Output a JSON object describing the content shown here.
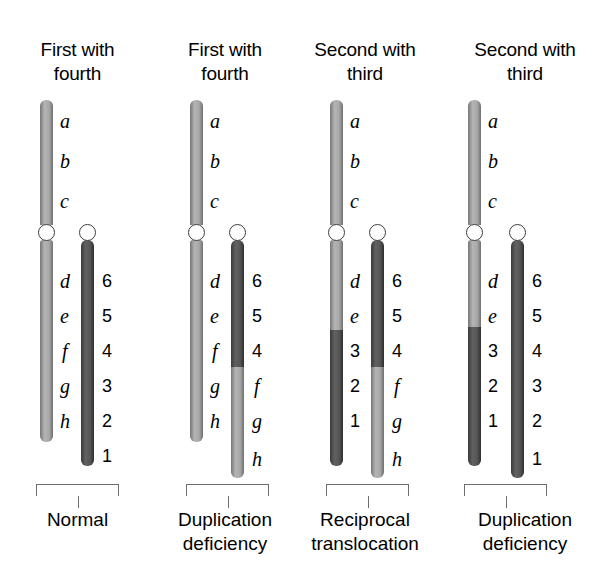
{
  "figure": {
    "title_visible": false,
    "background": "#ffffff",
    "colors": {
      "light_chromatid": "#9d9d9d",
      "dark_chromatid": "#4a4a4a",
      "centromere_fill": "#ffffff",
      "centromere_stroke": "#3d3d3d",
      "bracket": "#6e6e6e",
      "text": "#000000"
    }
  },
  "panels": [
    {
      "id": "panel-normal",
      "heading": "First with\nfourth",
      "caption": "Normal",
      "left": 0,
      "width": 155,
      "chromosomes": [
        {
          "id": "chrom-1-left",
          "x": 40,
          "width": 13,
          "top": 100,
          "bottom": 442,
          "centromere_y": 232,
          "segments": [
            {
              "from": 100,
              "to": 225,
              "shade": "light"
            },
            {
              "from": 240,
              "to": 442,
              "shade": "light"
            }
          ],
          "labels": [
            {
              "text": "a",
              "style": "italic",
              "x": 60,
              "y": 112
            },
            {
              "text": "b",
              "style": "italic",
              "x": 60,
              "y": 152
            },
            {
              "text": "c",
              "style": "italic",
              "x": 60,
              "y": 192
            },
            {
              "text": "d",
              "style": "italic",
              "x": 60,
              "y": 272
            },
            {
              "text": "e",
              "style": "italic",
              "x": 60,
              "y": 307
            },
            {
              "text": "f",
              "style": "italic",
              "x": 62,
              "y": 342
            },
            {
              "text": "g",
              "style": "italic",
              "x": 60,
              "y": 377
            },
            {
              "text": "h",
              "style": "italic",
              "x": 60,
              "y": 412
            }
          ]
        },
        {
          "id": "chrom-1-right",
          "x": 81,
          "width": 13,
          "top": 240,
          "bottom": 466,
          "centromere_y": 232,
          "segments": [
            {
              "from": 240,
              "to": 466,
              "shade": "dark"
            }
          ],
          "labels": [
            {
              "text": "6",
              "style": "upright",
              "x": 102,
              "y": 272
            },
            {
              "text": "5",
              "style": "upright",
              "x": 102,
              "y": 307
            },
            {
              "text": "4",
              "style": "upright",
              "x": 102,
              "y": 342
            },
            {
              "text": "3",
              "style": "upright",
              "x": 102,
              "y": 377
            },
            {
              "text": "2",
              "style": "upright",
              "x": 102,
              "y": 412
            },
            {
              "text": "1",
              "style": "upright",
              "x": 102,
              "y": 447
            }
          ]
        }
      ],
      "bracket": {
        "x": 36,
        "width": 83,
        "y": 484,
        "height": 12,
        "stem_height": 12
      }
    },
    {
      "id": "panel-dup-def-1",
      "heading": "First with\nfourth",
      "caption": "Duplication\ndeficiency",
      "left": 155,
      "width": 140,
      "chromosomes": [
        {
          "id": "chrom-2-left",
          "x": 190,
          "width": 13,
          "top": 100,
          "bottom": 442,
          "centromere_y": 232,
          "segments": [
            {
              "from": 100,
              "to": 225,
              "shade": "light"
            },
            {
              "from": 240,
              "to": 442,
              "shade": "light"
            }
          ],
          "labels": [
            {
              "text": "a",
              "style": "italic",
              "x": 210,
              "y": 112
            },
            {
              "text": "b",
              "style": "italic",
              "x": 210,
              "y": 152
            },
            {
              "text": "c",
              "style": "italic",
              "x": 210,
              "y": 192
            },
            {
              "text": "d",
              "style": "italic",
              "x": 210,
              "y": 272
            },
            {
              "text": "e",
              "style": "italic",
              "x": 210,
              "y": 307
            },
            {
              "text": "f",
              "style": "italic",
              "x": 212,
              "y": 342
            },
            {
              "text": "g",
              "style": "italic",
              "x": 210,
              "y": 377
            },
            {
              "text": "h",
              "style": "italic",
              "x": 210,
              "y": 412
            }
          ]
        },
        {
          "id": "chrom-2-right",
          "x": 231,
          "width": 13,
          "top": 240,
          "bottom": 478,
          "centromere_y": 232,
          "segments": [
            {
              "from": 240,
              "to": 367,
              "shade": "dark"
            },
            {
              "from": 367,
              "to": 478,
              "shade": "light"
            }
          ],
          "labels": [
            {
              "text": "6",
              "style": "upright",
              "x": 252,
              "y": 272
            },
            {
              "text": "5",
              "style": "upright",
              "x": 252,
              "y": 307
            },
            {
              "text": "4",
              "style": "upright",
              "x": 252,
              "y": 342
            },
            {
              "text": "f",
              "style": "italic",
              "x": 254,
              "y": 377
            },
            {
              "text": "g",
              "style": "italic",
              "x": 252,
              "y": 412
            },
            {
              "text": "h",
              "style": "italic",
              "x": 252,
              "y": 450
            }
          ]
        }
      ],
      "bracket": {
        "x": 186,
        "width": 83,
        "y": 484,
        "height": 12,
        "stem_height": 12
      }
    },
    {
      "id": "panel-recip-trans",
      "heading": "Second with\nthird",
      "caption": "Reciprocal\ntranslocation",
      "left": 295,
      "width": 140,
      "chromosomes": [
        {
          "id": "chrom-3-left",
          "x": 330,
          "width": 13,
          "top": 100,
          "bottom": 466,
          "centromere_y": 232,
          "segments": [
            {
              "from": 100,
              "to": 225,
              "shade": "light"
            },
            {
              "from": 240,
              "to": 330,
              "shade": "light"
            },
            {
              "from": 330,
              "to": 466,
              "shade": "dark"
            }
          ],
          "labels": [
            {
              "text": "a",
              "style": "italic",
              "x": 350,
              "y": 112
            },
            {
              "text": "b",
              "style": "italic",
              "x": 350,
              "y": 152
            },
            {
              "text": "c",
              "style": "italic",
              "x": 350,
              "y": 192
            },
            {
              "text": "d",
              "style": "italic",
              "x": 350,
              "y": 272
            },
            {
              "text": "e",
              "style": "italic",
              "x": 350,
              "y": 307
            },
            {
              "text": "3",
              "style": "upright",
              "x": 350,
              "y": 342
            },
            {
              "text": "2",
              "style": "upright",
              "x": 350,
              "y": 377
            },
            {
              "text": "1",
              "style": "upright",
              "x": 350,
              "y": 412
            }
          ]
        },
        {
          "id": "chrom-3-right",
          "x": 371,
          "width": 13,
          "top": 240,
          "bottom": 478,
          "centromere_y": 232,
          "segments": [
            {
              "from": 240,
              "to": 367,
              "shade": "dark"
            },
            {
              "from": 367,
              "to": 478,
              "shade": "light"
            }
          ],
          "labels": [
            {
              "text": "6",
              "style": "upright",
              "x": 392,
              "y": 272
            },
            {
              "text": "5",
              "style": "upright",
              "x": 392,
              "y": 307
            },
            {
              "text": "4",
              "style": "upright",
              "x": 392,
              "y": 342
            },
            {
              "text": "f",
              "style": "italic",
              "x": 394,
              "y": 377
            },
            {
              "text": "g",
              "style": "italic",
              "x": 392,
              "y": 412
            },
            {
              "text": "h",
              "style": "italic",
              "x": 392,
              "y": 450
            }
          ]
        }
      ],
      "bracket": {
        "x": 326,
        "width": 83,
        "y": 484,
        "height": 12,
        "stem_height": 12
      }
    },
    {
      "id": "panel-dup-def-2",
      "heading": "Second with\nthird",
      "caption": "Duplication\ndeficiency",
      "left": 435,
      "width": 180,
      "chromosomes": [
        {
          "id": "chrom-4-left",
          "x": 468,
          "width": 13,
          "top": 100,
          "bottom": 466,
          "centromere_y": 232,
          "segments": [
            {
              "from": 100,
              "to": 225,
              "shade": "light"
            },
            {
              "from": 240,
              "to": 327,
              "shade": "light"
            },
            {
              "from": 327,
              "to": 466,
              "shade": "dark"
            }
          ],
          "labels": [
            {
              "text": "a",
              "style": "italic",
              "x": 488,
              "y": 112
            },
            {
              "text": "b",
              "style": "italic",
              "x": 488,
              "y": 152
            },
            {
              "text": "c",
              "style": "italic",
              "x": 488,
              "y": 192
            },
            {
              "text": "d",
              "style": "italic",
              "x": 488,
              "y": 272
            },
            {
              "text": "e",
              "style": "italic",
              "x": 488,
              "y": 307
            },
            {
              "text": "3",
              "style": "upright",
              "x": 488,
              "y": 342
            },
            {
              "text": "2",
              "style": "upright",
              "x": 488,
              "y": 377
            },
            {
              "text": "1",
              "style": "upright",
              "x": 488,
              "y": 412
            }
          ]
        },
        {
          "id": "chrom-4-right",
          "x": 511,
          "width": 13,
          "top": 240,
          "bottom": 478,
          "centromere_y": 232,
          "segments": [
            {
              "from": 240,
              "to": 478,
              "shade": "dark"
            }
          ],
          "labels": [
            {
              "text": "6",
              "style": "upright",
              "x": 532,
              "y": 272
            },
            {
              "text": "5",
              "style": "upright",
              "x": 532,
              "y": 307
            },
            {
              "text": "4",
              "style": "upright",
              "x": 532,
              "y": 342
            },
            {
              "text": "3",
              "style": "upright",
              "x": 532,
              "y": 377
            },
            {
              "text": "2",
              "style": "upright",
              "x": 532,
              "y": 412
            },
            {
              "text": "1",
              "style": "upright",
              "x": 532,
              "y": 450
            }
          ]
        }
      ],
      "bracket": {
        "x": 464,
        "width": 83,
        "y": 484,
        "height": 12,
        "stem_height": 12
      }
    }
  ],
  "captions_y": 508
}
